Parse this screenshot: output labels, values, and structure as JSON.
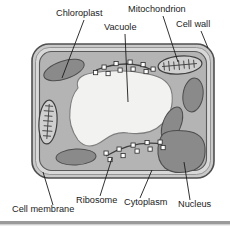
{
  "diagram": {
    "background_color": "#ffffff",
    "colors": {
      "cytoplasm": "#b4b4b4",
      "organelle_dark": "#8a8a8a",
      "vacuole": "#f2f2f0",
      "cell_wall_outer": "#6e6e6e",
      "cell_wall_band": "#c9c9c9",
      "membrane_line": "#5a5a5a",
      "ribosome_fill": "#ffffff",
      "text": "#1b1b1b",
      "divider": "#9a9a9a"
    },
    "labels": [
      {
        "id": "chloroplast",
        "text": "Chloroplast",
        "x": 56,
        "y": 16,
        "anchor": "start"
      },
      {
        "id": "mitochondrion",
        "text": "Mitochondrion",
        "x": 128,
        "y": 12,
        "anchor": "start"
      },
      {
        "id": "vacuole",
        "text": "Vacuole",
        "x": 104,
        "y": 30,
        "anchor": "start"
      },
      {
        "id": "cell-wall",
        "text": "Cell wall",
        "x": 176,
        "y": 27,
        "anchor": "start"
      },
      {
        "id": "cell-membrane",
        "text": "Cell membrane",
        "x": 12,
        "y": 212,
        "anchor": "start"
      },
      {
        "id": "ribosome",
        "text": "Ribosome",
        "x": 76,
        "y": 203,
        "anchor": "start"
      },
      {
        "id": "cytoplasm",
        "text": "Cytoplasm",
        "x": 124,
        "y": 205,
        "anchor": "start"
      },
      {
        "id": "nucleus",
        "text": "Nucleus",
        "x": 178,
        "y": 207,
        "anchor": "start"
      }
    ],
    "leaders": [
      {
        "id": "chloroplast-leader",
        "d": "M 84 20 L 62 78"
      },
      {
        "id": "mitochondrion-leader",
        "d": "M 163 16 L 178 62"
      },
      {
        "id": "vacuole-leader",
        "d": "M 125 34 L 128 102"
      },
      {
        "id": "cell-wall-leader",
        "d": "M 201 31 L 207 48"
      },
      {
        "id": "cell-membrane-leader",
        "d": "M 53 205 L 43 172"
      },
      {
        "id": "ribosome-leader",
        "d": "M 100 196 L 112 158"
      },
      {
        "id": "cytoplasm-leader",
        "d": "M 140 198 L 152 170"
      },
      {
        "id": "nucleus-leader",
        "d": "M 190 200 L 184 162"
      }
    ],
    "structures": {
      "cell_wall": {
        "name": "cell-wall",
        "x": 32,
        "y": 44,
        "width": 182,
        "height": 134,
        "radius": 16
      },
      "vacuole": {
        "name": "vacuole"
      },
      "chloroplasts": [
        {
          "id": "chloroplast-top-left",
          "cx": 64,
          "cy": 70,
          "rx": 21,
          "ry": 9,
          "rot": -18
        },
        {
          "id": "chloroplast-bottom-left",
          "cx": 76,
          "cy": 157,
          "rx": 20,
          "ry": 8,
          "rot": -3
        },
        {
          "id": "chloroplast-right-upper",
          "cx": 193,
          "cy": 95,
          "rx": 10,
          "ry": 17,
          "rot": 8
        },
        {
          "id": "chloroplast-right-mid",
          "cx": 172,
          "cy": 124,
          "rx": 9,
          "ry": 18,
          "rot": 22
        }
      ],
      "mitochondria": [
        {
          "id": "mitochondrion-top",
          "cx": 180,
          "cy": 65,
          "rx": 22,
          "ry": 9,
          "rot": -5,
          "cristae": 7
        },
        {
          "id": "mitochondrion-left",
          "cx": 48,
          "cy": 122,
          "rx": 9,
          "ry": 22,
          "rot": 4,
          "cristae": 7
        }
      ],
      "nucleus": {
        "id": "nucleus-blob",
        "cx": 183,
        "cy": 152,
        "rx": 24,
        "ry": 20
      },
      "ribosome_chains": [
        {
          "id": "ribosome-chain-top",
          "path": "M 96 70 Q 128 58 152 70",
          "beads": 9
        },
        {
          "id": "ribosome-chain-bottom",
          "path": "M 106 156 Q 134 140 162 144",
          "beads": 9
        }
      ]
    },
    "divider": {
      "name": "bottom-divider",
      "y": 222
    }
  }
}
